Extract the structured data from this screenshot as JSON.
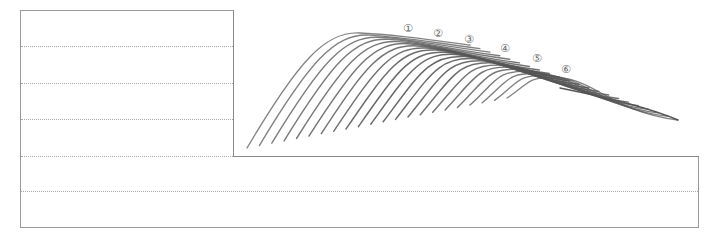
{
  "sheet": {
    "border_color": "#9a9a9a",
    "ruled_lines": [
      {
        "y": 46,
        "x1": 21,
        "x2": 233
      },
      {
        "y": 83,
        "x1": 21,
        "x2": 233
      },
      {
        "y": 119,
        "x1": 21,
        "x2": 233
      },
      {
        "y": 156,
        "x1": 21,
        "x2": 233
      },
      {
        "y": 191,
        "x1": 21,
        "x2": 698
      }
    ]
  },
  "illustration": {
    "stroke_color": "#555555",
    "curve_count": 22,
    "markers": [
      {
        "label": "①",
        "x": 408,
        "y": 28
      },
      {
        "label": "②",
        "x": 438,
        "y": 33
      },
      {
        "label": "③",
        "x": 469,
        "y": 39
      },
      {
        "label": "④",
        "x": 505,
        "y": 48
      },
      {
        "label": "⑤",
        "x": 537,
        "y": 58
      },
      {
        "label": "⑥",
        "x": 566,
        "y": 69
      }
    ]
  }
}
